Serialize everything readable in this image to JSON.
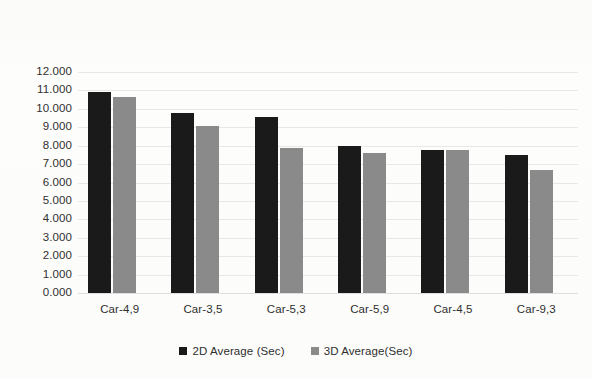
{
  "chart_data": {
    "type": "bar",
    "title": "",
    "subtitle": "",
    "xlabel": "",
    "ylabel": "",
    "grid": true,
    "legend_position": "bottom",
    "categories": [
      "Car-4,9",
      "Car-3,5",
      "Car-5,3",
      "Car-5,9",
      "Car-4,5",
      "Car-9,3"
    ],
    "ylim": [
      0,
      12
    ],
    "ytick_step": 1,
    "ytick_labels": [
      "0.000",
      "1.000",
      "2.000",
      "3.000",
      "4.000",
      "5.000",
      "6.000",
      "7.000",
      "8.000",
      "9.000",
      "10.000",
      "11.000",
      "12.000"
    ],
    "series": [
      {
        "name": "2D Average (Sec)",
        "color": "#1a1a1a",
        "values": [
          10.9,
          9.77,
          9.56,
          7.98,
          7.77,
          7.49
        ]
      },
      {
        "name": "3D Average(Sec)",
        "color": "#8a8a8a",
        "values": [
          10.65,
          9.06,
          7.87,
          7.6,
          7.78,
          6.68
        ]
      }
    ]
  },
  "legend": {
    "items": [
      {
        "label": "2D Average (Sec)",
        "marker": "square-swatch-black"
      },
      {
        "label": "3D Average(Sec)",
        "marker": "square-swatch-gray"
      }
    ]
  }
}
